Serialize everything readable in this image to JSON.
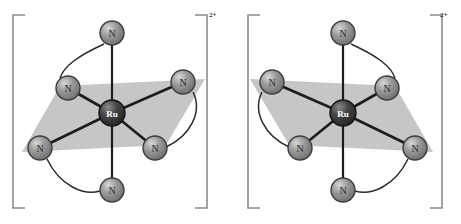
{
  "figure": {
    "background_color": "#ffffff",
    "atom_label_ru": "Ru",
    "atom_label_n": "N",
    "colors": {
      "metal_fill": "#3a3a3a",
      "metal_highlight": "#7a7a7a",
      "metal_stroke": "#1a1a1a",
      "metal_text": "#ffffff",
      "donor_fill": "#8e8e8e",
      "donor_highlight": "#c9c9c9",
      "donor_stroke": "#3d3d3d",
      "donor_text": "#2a2a2a",
      "plane_fill": "#c6c6c6",
      "bond_stroke": "#1c1c1c",
      "arc_stroke": "#2a2a2a",
      "bracket_stroke": "#8c8c8c",
      "charge_text": "#2b2b2b"
    }
  },
  "complexes": [
    {
      "id": "complex-left",
      "name": "delta-enantiomer",
      "charge": "2+",
      "center": {
        "label": "Ru",
        "x": 112,
        "y": 113,
        "r": 13
      },
      "donors": [
        {
          "id": "n-axial-top",
          "label": "N",
          "x": 112,
          "y": 33,
          "r": 12
        },
        {
          "id": "n-equatorial-upper-left",
          "label": "N",
          "x": 68,
          "y": 88,
          "r": 12
        },
        {
          "id": "n-equatorial-right",
          "label": "N",
          "x": 183,
          "y": 82,
          "r": 12
        },
        {
          "id": "n-equatorial-left",
          "label": "N",
          "x": 40,
          "y": 148,
          "r": 12
        },
        {
          "id": "n-equatorial-lower-right",
          "label": "N",
          "x": 155,
          "y": 148,
          "r": 12
        },
        {
          "id": "n-axial-bottom",
          "label": "N",
          "x": 112,
          "y": 190,
          "r": 12
        }
      ],
      "plane": [
        {
          "x": 22,
          "y": 152
        },
        {
          "x": 60,
          "y": 86
        },
        {
          "x": 205,
          "y": 79
        },
        {
          "x": 166,
          "y": 145
        }
      ],
      "bonds": [
        {
          "from": "center",
          "to": "n-axial-top"
        },
        {
          "from": "center",
          "to": "n-axial-bottom"
        },
        {
          "from": "center",
          "to": "n-equatorial-upper-left"
        },
        {
          "from": "center",
          "to": "n-equatorial-right"
        },
        {
          "from": "center",
          "to": "n-equatorial-left"
        },
        {
          "from": "center",
          "to": "n-equatorial-lower-right"
        }
      ],
      "chelate_arcs": [
        {
          "id": "arc-top-left",
          "path": "M 104 44 C 78 56 64 66 60 78"
        },
        {
          "id": "arc-right",
          "path": "M 193 92 C 203 112 190 136 166 147"
        },
        {
          "id": "arc-bottom-left",
          "path": "M 47 159 C 60 186 84 196 100 191"
        }
      ],
      "bracket": {
        "left": {
          "x": 13,
          "top": 15,
          "bottom": 208,
          "tick": 12
        },
        "right": {
          "x": 207,
          "top": 15,
          "bottom": 208,
          "tick": 12
        }
      },
      "charge_position": {
        "x": 209,
        "y": 12
      }
    },
    {
      "id": "complex-right",
      "name": "lambda-enantiomer",
      "charge": "2+",
      "center": {
        "label": "Ru",
        "x": 343,
        "y": 113,
        "r": 13
      },
      "donors": [
        {
          "id": "n-axial-top",
          "label": "N",
          "x": 343,
          "y": 33,
          "r": 12
        },
        {
          "id": "n-equatorial-upper-right",
          "label": "N",
          "x": 387,
          "y": 88,
          "r": 12
        },
        {
          "id": "n-equatorial-left",
          "label": "N",
          "x": 272,
          "y": 82,
          "r": 12
        },
        {
          "id": "n-equatorial-right",
          "label": "N",
          "x": 415,
          "y": 148,
          "r": 12
        },
        {
          "id": "n-equatorial-lower-left",
          "label": "N",
          "x": 300,
          "y": 148,
          "r": 12
        },
        {
          "id": "n-axial-bottom",
          "label": "N",
          "x": 343,
          "y": 190,
          "r": 12
        }
      ],
      "plane": [
        {
          "x": 433,
          "y": 152
        },
        {
          "x": 395,
          "y": 86
        },
        {
          "x": 250,
          "y": 79
        },
        {
          "x": 289,
          "y": 145
        }
      ],
      "bonds": [
        {
          "from": "center",
          "to": "n-axial-top"
        },
        {
          "from": "center",
          "to": "n-axial-bottom"
        },
        {
          "from": "center",
          "to": "n-equatorial-upper-right"
        },
        {
          "from": "center",
          "to": "n-equatorial-left"
        },
        {
          "from": "center",
          "to": "n-equatorial-right"
        },
        {
          "from": "center",
          "to": "n-equatorial-lower-left"
        }
      ],
      "chelate_arcs": [
        {
          "id": "arc-top-right",
          "path": "M 351 44 C 377 56 391 66 395 78"
        },
        {
          "id": "arc-left",
          "path": "M 262 92 C 252 112 265 136 289 147"
        },
        {
          "id": "arc-bottom-right",
          "path": "M 408 159 C 395 186 371 196 355 191"
        }
      ],
      "bracket": {
        "left": {
          "x": 248,
          "top": 15,
          "bottom": 208,
          "tick": 12
        },
        "right": {
          "x": 442,
          "top": 15,
          "bottom": 208,
          "tick": 12
        }
      },
      "charge_position": {
        "x": 440,
        "y": 12
      }
    }
  ]
}
